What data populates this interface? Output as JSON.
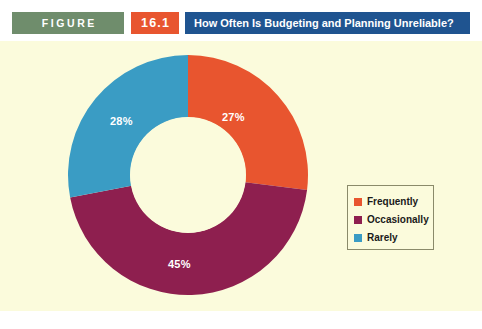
{
  "header": {
    "figure_tag": "FIGURE",
    "figure_number": "16.1",
    "title": "How Often Is Budgeting and Planning Unreliable?",
    "tag_color": "#6f8d6c",
    "number_color": "#e8552f",
    "title_bar_color": "#1f5490"
  },
  "panel": {
    "background_color": "#fbfbdc"
  },
  "legend": {
    "items": [
      {
        "label": "Frequently",
        "color": "#e8552f"
      },
      {
        "label": "Occasionally",
        "color": "#8e1f4f"
      },
      {
        "label": "Rarely",
        "color": "#3a9cc4"
      }
    ]
  },
  "labels": {
    "frequently": "27%",
    "occasionally": "45%",
    "rarely": "28%"
  },
  "chart_data": {
    "type": "pie",
    "variant": "donut",
    "title": "How Often Is Budgeting and Planning Unreliable?",
    "categories": [
      "Frequently",
      "Occasionally",
      "Rarely"
    ],
    "values": [
      27,
      45,
      28
    ],
    "value_labels": [
      "27%",
      "45%",
      "28%"
    ],
    "unit": "percent",
    "colors": [
      "#e8552f",
      "#8e1f4f",
      "#3a9cc4"
    ],
    "start_angle_deg": 0,
    "direction": "clockwise",
    "inner_radius_ratio": 0.48,
    "legend_position": "right",
    "grid": false,
    "xlabel": "",
    "ylabel": ""
  }
}
